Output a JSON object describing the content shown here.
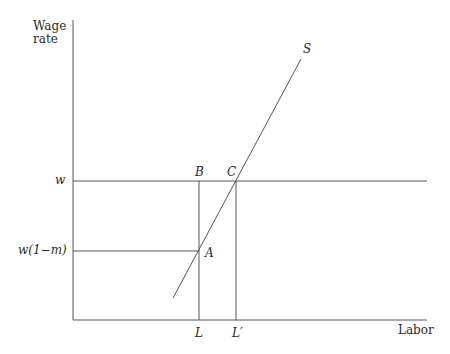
{
  "diagram": {
    "title": "",
    "axes": {
      "y_label_line1": "Wage",
      "y_label_line2": "rate",
      "x_label": "Labor"
    },
    "price_labels": {
      "w": "w",
      "w_net": "w(1−m)"
    },
    "quantity_labels": {
      "L": "L",
      "L_prime": "L′"
    },
    "points": {
      "A": "A",
      "B": "B",
      "C": "C"
    },
    "curves": {
      "supply": "S"
    },
    "colors": {
      "line": "#555555",
      "text": "#2a2a2a",
      "background": "#ffffff"
    }
  }
}
